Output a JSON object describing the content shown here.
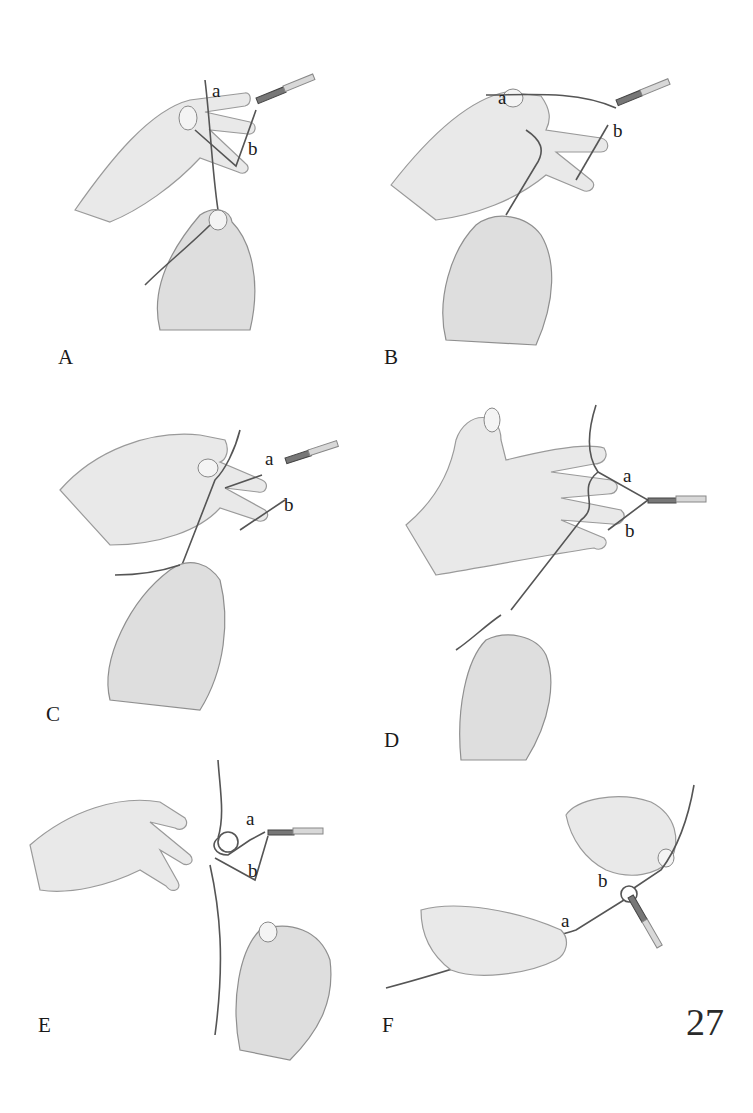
{
  "figure": {
    "page_number": "27",
    "panels": [
      {
        "id": "A",
        "label": "A",
        "strand_labels": [
          "a",
          "b"
        ]
      },
      {
        "id": "B",
        "label": "B",
        "strand_labels": [
          "a",
          "b"
        ]
      },
      {
        "id": "C",
        "label": "C",
        "strand_labels": [
          "a",
          "b"
        ]
      },
      {
        "id": "D",
        "label": "D",
        "strand_labels": [
          "a",
          "b"
        ]
      },
      {
        "id": "E",
        "label": "E",
        "strand_labels": [
          "a",
          "b"
        ]
      },
      {
        "id": "F",
        "label": "F",
        "strand_labels": [
          "a",
          "b"
        ]
      }
    ]
  }
}
